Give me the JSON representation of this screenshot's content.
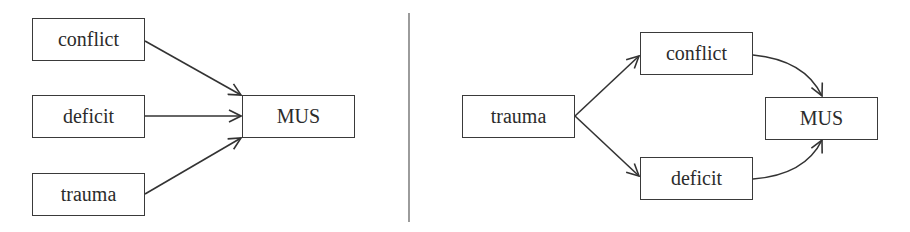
{
  "diagram": {
    "left_panel": {
      "nodes": {
        "conflict": "conflict",
        "deficit": "deficit",
        "trauma": "trauma",
        "mus": "MUS"
      },
      "edges": [
        {
          "from": "conflict",
          "to": "MUS"
        },
        {
          "from": "deficit",
          "to": "MUS"
        },
        {
          "from": "trauma",
          "to": "MUS"
        }
      ]
    },
    "right_panel": {
      "nodes": {
        "trauma": "trauma",
        "conflict": "conflict",
        "deficit": "deficit",
        "mus": "MUS"
      },
      "edges": [
        {
          "from": "trauma",
          "to": "conflict"
        },
        {
          "from": "trauma",
          "to": "deficit"
        },
        {
          "from": "conflict",
          "to": "MUS"
        },
        {
          "from": "deficit",
          "to": "MUS"
        }
      ]
    },
    "colors": {
      "stroke": "#3a3a3a",
      "text": "#2b2b2b",
      "background": "#ffffff"
    }
  }
}
